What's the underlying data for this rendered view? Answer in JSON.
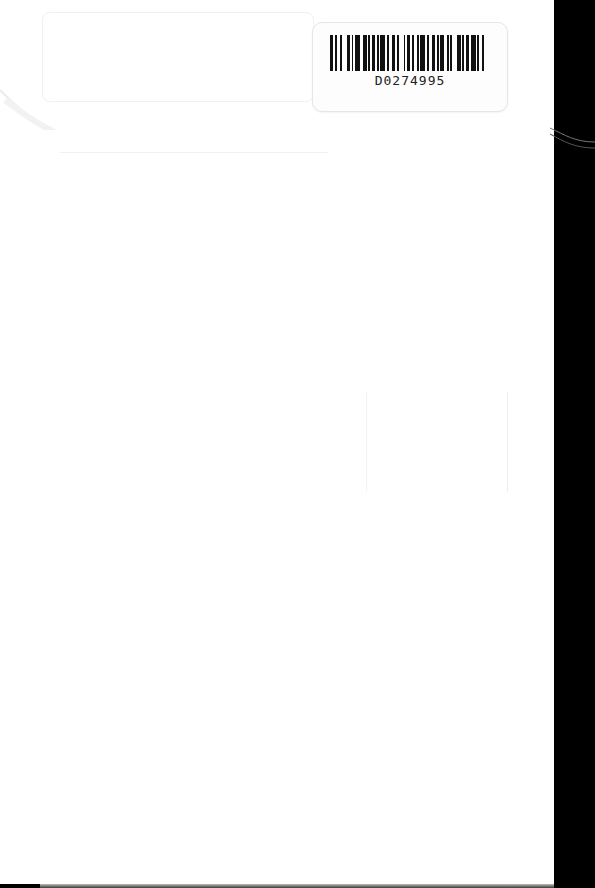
{
  "page": {
    "background": "#ffffff",
    "border_color": "#000000"
  },
  "barcode_label": {
    "code": "D0274995",
    "bar_pattern": [
      2,
      1,
      1,
      2,
      1,
      3,
      2,
      1,
      1,
      1,
      3,
      2,
      2,
      1,
      1,
      1,
      2,
      1,
      1,
      1,
      3,
      1,
      1,
      2,
      2,
      1,
      1,
      3,
      1,
      1,
      2,
      1,
      1,
      2,
      1,
      1,
      3,
      1,
      1,
      2,
      2,
      1,
      1,
      1,
      2,
      2,
      1,
      1,
      1,
      3,
      2,
      1,
      1,
      1,
      2,
      1,
      3,
      1,
      1,
      2,
      1,
      1
    ]
  }
}
